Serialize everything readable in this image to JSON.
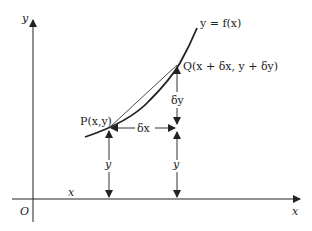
{
  "diagram": {
    "type": "calculus-increment",
    "axes": {
      "x_label": "x",
      "y_label": "y",
      "origin_label": "O"
    },
    "curve": {
      "label": "y = f(x)"
    },
    "points": {
      "P": {
        "label": "P(x,y)"
      },
      "Q": {
        "label": "Q(x + δx, y + δy)"
      }
    },
    "annotations": {
      "delta_x": "δx",
      "delta_y": "δy",
      "height_P": "y",
      "height_R": "y",
      "x_distance": "x"
    },
    "colors": {
      "stroke": "#222222",
      "background": "#ffffff"
    }
  }
}
